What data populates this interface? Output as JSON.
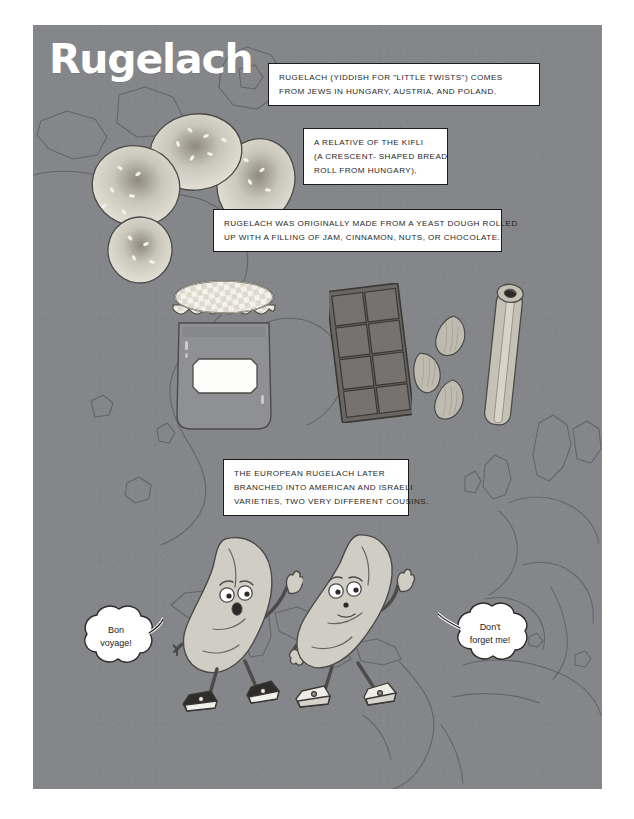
{
  "poster": {
    "title": "Rugelach",
    "background_color": "#85868a",
    "page_background_color": "#ffffff"
  },
  "captions": [
    {
      "id": "caption-origin",
      "lines": [
        "RUGELACH (YIDDISH FOR \"LITTLE TWISTS\") COMES",
        "FROM JEWS IN HUNGARY, AUSTRIA, AND POLAND."
      ]
    },
    {
      "id": "caption-kifli",
      "lines": [
        "A RELATIVE OF THE KIFLI",
        "(A CRESCENT- SHAPED BREAD",
        "ROLL FROM HUNGARY),"
      ]
    },
    {
      "id": "caption-dough",
      "lines": [
        "RUGELACH WAS ORIGINALLY MADE FROM A YEAST DOUGH ROLLED",
        "UP WITH A FILLING OF JAM, CINNAMON, NUTS, OR CHOCOLATE."
      ]
    },
    {
      "id": "caption-branches",
      "lines": [
        "THE EUROPEAN RUGELACH LATER",
        "BRANCHED INTO AMERICAN AND ISRAELI",
        "VARIETIES, TWO VERY DIFFERENT COUSINS."
      ]
    }
  ],
  "bubbles": [
    {
      "id": "bubble-bon-voyage",
      "line1": "Bon",
      "line2": "voyage!"
    },
    {
      "id": "bubble-dont-forget",
      "line1": "Don't",
      "line2": "forget me!"
    }
  ],
  "illustrations": {
    "pastry": {
      "name": "rugelach-pastry",
      "lobes": 4,
      "fill": "#d8d6cd",
      "speckles": true
    },
    "jar": {
      "name": "jam-jar",
      "body_fill": "#9a9a9c",
      "lid_pattern": "checkered",
      "label": ""
    },
    "chocolate": {
      "name": "chocolate-bar",
      "rows": 4,
      "columns": 2,
      "fill": "#6c6a66"
    },
    "almonds": {
      "name": "almonds",
      "count": 3,
      "fill": "#b9b5aa"
    },
    "cinnamon": {
      "name": "cinnamon-stick",
      "count": 1,
      "fill": "#c2bdb1"
    },
    "characters": [
      {
        "name": "rugelach-character-left",
        "pose": "waving",
        "shoes": "sneakers"
      },
      {
        "name": "rugelach-character-right",
        "pose": "waving",
        "shoes": "sneakers"
      }
    ]
  },
  "map": {
    "name": "world-map-outline",
    "stroke": "#5d5f63",
    "regions": [
      "North America",
      "Europe",
      "Africa",
      "Greenland"
    ]
  }
}
